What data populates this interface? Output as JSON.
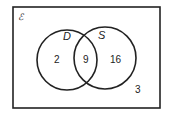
{
  "diagram": {
    "type": "venn",
    "universal_symbol": "ℰ",
    "sets": [
      {
        "label": "D",
        "only": "2"
      },
      {
        "label": "S",
        "only": "16"
      }
    ],
    "intersection": "9",
    "outside": "3"
  }
}
